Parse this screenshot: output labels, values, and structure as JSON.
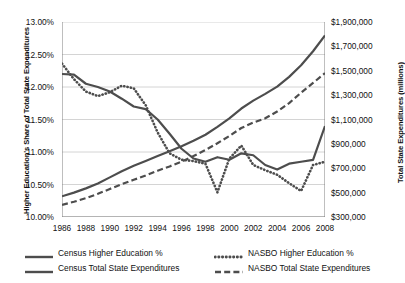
{
  "chart_data": {
    "type": "line",
    "title": "",
    "xlabel": "",
    "ylabel": "Higher Education's Share of Total State Expenditures",
    "y2label": "Total State Expenditures (millions)",
    "grid": true,
    "legend_position": "bottom",
    "x": [
      1986,
      1987,
      1988,
      1989,
      1990,
      1991,
      1992,
      1993,
      1994,
      1995,
      1996,
      1997,
      1998,
      1999,
      2000,
      2001,
      2002,
      2003,
      2004,
      2005,
      2006,
      2007,
      2008
    ],
    "xtick_labels": [
      "1986",
      "1988",
      "1990",
      "1992",
      "1994",
      "1996",
      "1998",
      "2000",
      "2002",
      "2004",
      "2006",
      "2008"
    ],
    "xtick_values": [
      1986,
      1988,
      1990,
      1992,
      1994,
      1996,
      1998,
      2000,
      2002,
      2004,
      2006,
      2008
    ],
    "ylim": [
      10.0,
      13.0
    ],
    "ytick_labels": [
      "10.00%",
      "10.50%",
      "11.00%",
      "11.50%",
      "12.00%",
      "12.50%",
      "13.00%"
    ],
    "ytick_values": [
      10.0,
      10.5,
      11.0,
      11.5,
      12.0,
      12.5,
      13.0
    ],
    "y2lim": [
      300000,
      1900000
    ],
    "y2tick_labels": [
      "$300,000",
      "$500,000",
      "$700,000",
      "$900,000",
      "$1,100,000",
      "$1,300,000",
      "$1,500,000",
      "$1,700,000",
      "$1,900,000"
    ],
    "y2tick_values": [
      300000,
      500000,
      700000,
      900000,
      1100000,
      1300000,
      1500000,
      1700000,
      1900000
    ],
    "series": [
      {
        "name": "Census Higher Education %",
        "axis": "left",
        "style": "solid",
        "color": "#4d4d4d",
        "values": [
          12.2,
          12.19,
          12.05,
          12.0,
          11.93,
          11.82,
          11.7,
          11.66,
          11.5,
          11.28,
          11.05,
          10.9,
          10.85,
          10.92,
          10.88,
          10.98,
          10.95,
          10.8,
          10.73,
          10.82,
          10.85,
          10.88,
          11.4
        ]
      },
      {
        "name": "NASBO Higher Education %",
        "axis": "left",
        "style": "dotted",
        "color": "#4d4d4d",
        "values": [
          12.36,
          12.12,
          11.93,
          11.86,
          11.92,
          12.02,
          11.98,
          11.72,
          11.3,
          10.98,
          10.88,
          10.86,
          10.82,
          10.38,
          10.9,
          11.1,
          10.8,
          10.72,
          10.65,
          10.52,
          10.4,
          10.8,
          10.85
        ]
      },
      {
        "name": "Census Total State Expenditures",
        "axis": "right",
        "style": "solid",
        "color": "#4d4d4d",
        "values": [
          470000,
          500000,
          535000,
          575000,
          625000,
          675000,
          720000,
          760000,
          800000,
          840000,
          880000,
          925000,
          975000,
          1040000,
          1110000,
          1190000,
          1255000,
          1310000,
          1370000,
          1450000,
          1545000,
          1660000,
          1790000
        ]
      },
      {
        "name": "NASBO Total State Expenditures",
        "axis": "right",
        "style": "dashed",
        "color": "#4d4d4d",
        "values": [
          400000,
          425000,
          455000,
          490000,
          530000,
          570000,
          605000,
          640000,
          680000,
          715000,
          755000,
          800000,
          850000,
          905000,
          965000,
          1030000,
          1075000,
          1110000,
          1165000,
          1235000,
          1320000,
          1400000,
          1480000
        ]
      }
    ]
  },
  "legend": {
    "items": [
      {
        "label": "Census Higher Education %",
        "style": "solid"
      },
      {
        "label": "NASBO Higher Education %",
        "style": "dotted"
      },
      {
        "label": "Census Total State Expenditures",
        "style": "solid"
      },
      {
        "label": "NASBO Total State Expenditures",
        "style": "dashed"
      }
    ]
  }
}
